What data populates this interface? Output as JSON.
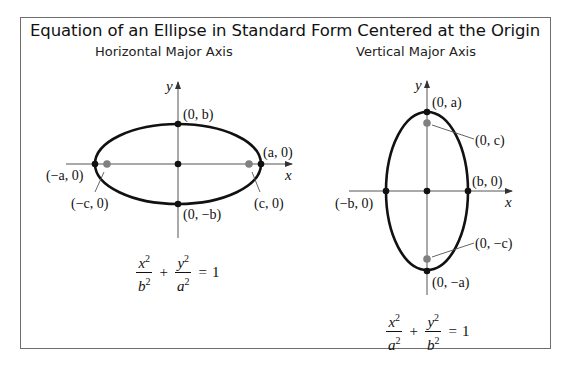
{
  "title": "Equation of an Ellipse in Standard Form Centered at the Origin",
  "panels": [
    {
      "subtitle": "Horizontal Major Axis",
      "axis_labels": {
        "x": "x",
        "y": "y"
      },
      "point_labels": {
        "top_vertex": "(0, b)",
        "bottom_vertex": "(0, −b)",
        "right_vertex": "(a, 0)",
        "left_vertex": "(−a, 0)",
        "right_focus": "(c, 0)",
        "left_focus": "(−c, 0)"
      },
      "equation": {
        "term1_num": "x",
        "term1_num_exp": "2",
        "term1_den": "b",
        "term1_den_exp": "2",
        "plus": "+",
        "term2_num": "y",
        "term2_num_exp": "2",
        "term2_den": "a",
        "term2_den_exp": "2",
        "equals": "=",
        "rhs": "1"
      }
    },
    {
      "subtitle": "Vertical Major Axis",
      "axis_labels": {
        "x": "x",
        "y": "y"
      },
      "point_labels": {
        "top_vertex": "(0, a)",
        "bottom_vertex": "(0, −a)",
        "right_vertex": "(b, 0)",
        "left_vertex": "(−b, 0)",
        "top_focus": "(0, c)",
        "bottom_focus": "(0, −c)"
      },
      "equation": {
        "term1_num": "x",
        "term1_num_exp": "2",
        "term1_den": "a",
        "term1_den_exp": "2",
        "plus": "+",
        "term2_num": "y",
        "term2_num_exp": "2",
        "term2_den": "b",
        "term2_den_exp": "2",
        "equals": "=",
        "rhs": "1"
      }
    }
  ],
  "colors": {
    "curve": "#111111",
    "axis": "#555555",
    "vertex_dot": "#111111",
    "focus_dot": "#808080",
    "frame": "#6e6e6e"
  }
}
